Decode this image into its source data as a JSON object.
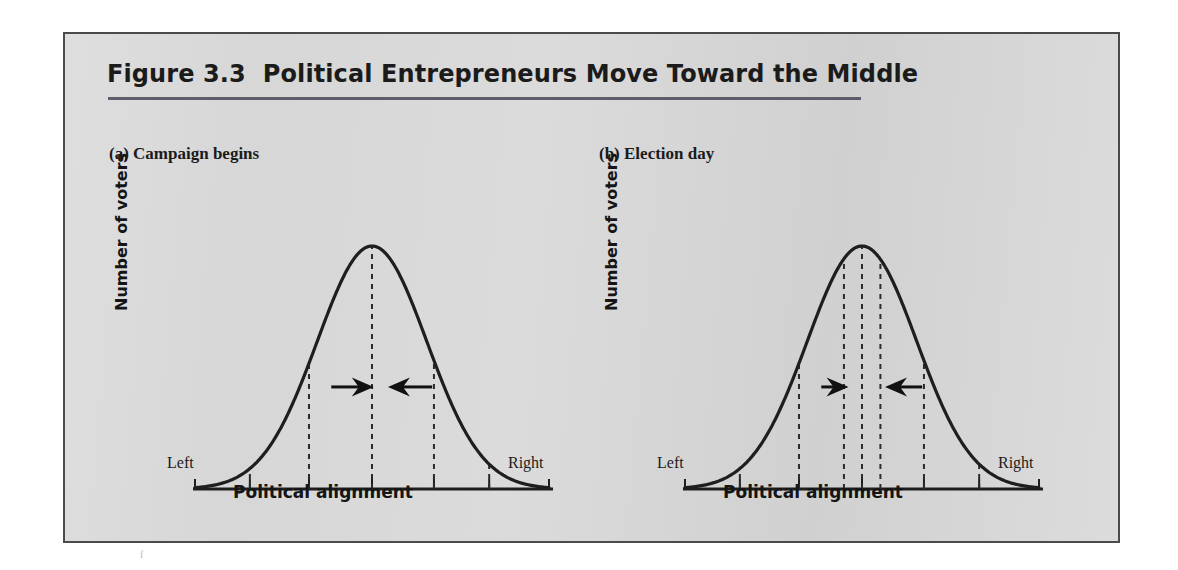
{
  "figure": {
    "title": "Figure 3.3  Political Entrepreneurs Move Toward the Middle",
    "panel_a_caption": "(a) Campaign begins",
    "panel_b_caption": "(b) Election day",
    "y_axis_label": "Number of voters",
    "x_axis_title": "Political alignment",
    "x_axis_left_label": "Left",
    "x_axis_right_label": "Right",
    "colors": {
      "panel_background": "#d7d7d7",
      "panel_border": "#4a4a4a",
      "title_text": "#1b1b1b",
      "title_rule": "#5d5d6b",
      "curve": "#1e1e1e",
      "dashed_line": "#2b2b2b",
      "arrow": "#111111",
      "page_background": "#ffffff"
    },
    "speck": "ſ"
  },
  "chart_data": [
    {
      "type": "line",
      "id": "panel-a",
      "title": "(a) Campaign begins",
      "xlabel": "Political alignment",
      "ylabel": "Number of voters",
      "xtick_labels": [
        "Left",
        "",
        "",
        "",
        "",
        "",
        "Right"
      ],
      "xtick_positions": [
        0,
        0.155,
        0.322,
        0.5,
        0.675,
        0.831,
        1
      ],
      "grid": false,
      "legend": false,
      "xlim": [
        0,
        1
      ],
      "ylim": [
        0,
        1
      ],
      "curve_shape": "normal-distribution bell curve",
      "x": [
        0.0,
        0.05,
        0.1,
        0.15,
        0.2,
        0.25,
        0.3,
        0.35,
        0.4,
        0.45,
        0.5,
        0.55,
        0.6,
        0.65,
        0.7,
        0.75,
        0.8,
        0.85,
        0.9,
        0.95,
        1.0
      ],
      "y": [
        0.0,
        0.02,
        0.05,
        0.1,
        0.18,
        0.3,
        0.46,
        0.65,
        0.84,
        0.97,
        1.0,
        0.97,
        0.84,
        0.65,
        0.46,
        0.3,
        0.18,
        0.1,
        0.05,
        0.02,
        0.0
      ],
      "markers": [
        {
          "name": "candidate-left-outer",
          "x": 0.155,
          "height_fraction": 0.18,
          "style": "dashed"
        },
        {
          "name": "candidate-left",
          "x": 0.322,
          "height_fraction": 0.53,
          "style": "dashed"
        },
        {
          "name": "median-voter-center",
          "x": 0.5,
          "height_fraction": 1.0,
          "style": "dashed"
        },
        {
          "name": "candidate-right",
          "x": 0.675,
          "height_fraction": 0.53,
          "style": "dashed"
        },
        {
          "name": "candidate-right-outer",
          "x": 0.831,
          "height_fraction": 0.18,
          "style": "dashed"
        }
      ],
      "annotations": [
        {
          "name": "arrow-right",
          "direction": "right",
          "from_x": 0.385,
          "to_x": 0.505,
          "y_fraction": 0.42
        },
        {
          "name": "arrow-left",
          "direction": "left",
          "from_x": 0.67,
          "to_x": 0.545,
          "y_fraction": 0.42
        }
      ]
    },
    {
      "type": "line",
      "id": "panel-b",
      "title": "(b) Election day",
      "xlabel": "Political alignment",
      "ylabel": "Number of voters",
      "xtick_labels": [
        "Left",
        "",
        "",
        "",
        "",
        "",
        "Right"
      ],
      "xtick_positions": [
        0,
        0.155,
        0.322,
        0.5,
        0.675,
        0.831,
        1
      ],
      "grid": false,
      "legend": false,
      "xlim": [
        0,
        1
      ],
      "ylim": [
        0,
        1
      ],
      "curve_shape": "normal-distribution bell curve",
      "x": [
        0.0,
        0.05,
        0.1,
        0.15,
        0.2,
        0.25,
        0.3,
        0.35,
        0.4,
        0.45,
        0.5,
        0.55,
        0.6,
        0.65,
        0.7,
        0.75,
        0.8,
        0.85,
        0.9,
        0.95,
        1.0
      ],
      "y": [
        0.0,
        0.02,
        0.05,
        0.1,
        0.18,
        0.3,
        0.46,
        0.65,
        0.84,
        0.97,
        1.0,
        0.97,
        0.84,
        0.65,
        0.46,
        0.3,
        0.18,
        0.1,
        0.05,
        0.02,
        0.0
      ],
      "markers": [
        {
          "name": "candidate-left-outer",
          "x": 0.155,
          "height_fraction": 0.18,
          "style": "dashed"
        },
        {
          "name": "candidate-left",
          "x": 0.322,
          "height_fraction": 0.53,
          "style": "dashed"
        },
        {
          "name": "candidate-left-moved",
          "x": 0.449,
          "height_fraction": 0.95,
          "style": "dashed"
        },
        {
          "name": "median-voter-center",
          "x": 0.5,
          "height_fraction": 1.0,
          "style": "dashed"
        },
        {
          "name": "candidate-right-moved",
          "x": 0.552,
          "height_fraction": 0.95,
          "style": "dashed"
        },
        {
          "name": "candidate-right",
          "x": 0.675,
          "height_fraction": 0.53,
          "style": "dashed"
        },
        {
          "name": "candidate-right-outer",
          "x": 0.831,
          "height_fraction": 0.18,
          "style": "dashed"
        }
      ],
      "annotations": [
        {
          "name": "arrow-right",
          "direction": "right",
          "from_x": 0.385,
          "to_x": 0.462,
          "y_fraction": 0.42
        },
        {
          "name": "arrow-left",
          "direction": "left",
          "from_x": 0.67,
          "to_x": 0.565,
          "y_fraction": 0.42
        }
      ]
    }
  ]
}
